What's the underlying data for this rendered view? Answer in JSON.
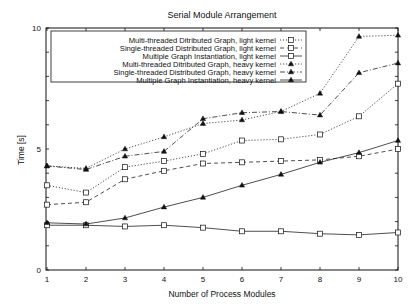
{
  "chart_data": {
    "type": "line",
    "title": "Serial Module Arrangement",
    "xlabel": "Number of Process Modules",
    "ylabel": "Time [s]",
    "xlim": [
      1,
      10
    ],
    "ylim": [
      0,
      10
    ],
    "x": [
      1,
      2,
      3,
      4,
      5,
      6,
      7,
      8,
      9,
      10
    ],
    "x_ticks": [
      "1",
      "2",
      "3",
      "4",
      "5",
      "6",
      "7",
      "8",
      "9",
      "10"
    ],
    "y_ticks": [
      "0",
      "5",
      "10"
    ],
    "grid": false,
    "legend_position": "upper-left-inside",
    "series": [
      {
        "name": "Multi-threaded Ditributed Graph, light kernel",
        "marker": "square",
        "line": "dotted",
        "values": [
          3.5,
          3.2,
          4.25,
          4.5,
          4.8,
          5.35,
          5.4,
          5.6,
          6.35,
          7.7
        ]
      },
      {
        "name": "Single-threaded Distributed Graph, light kernel",
        "marker": "square",
        "line": "dashed",
        "values": [
          2.7,
          2.8,
          3.75,
          4.1,
          4.4,
          4.45,
          4.5,
          4.55,
          4.7,
          5.0
        ]
      },
      {
        "name": "Multiple Graph Instantiation, light kernel",
        "marker": "square",
        "line": "solid",
        "values": [
          1.85,
          1.85,
          1.8,
          1.85,
          1.75,
          1.6,
          1.6,
          1.5,
          1.45,
          1.55
        ]
      },
      {
        "name": "Multi-threaded Ditributed Graph, heavy kernel",
        "marker": "triangle",
        "line": "dotted",
        "values": [
          4.3,
          4.2,
          5.0,
          5.5,
          6.05,
          6.2,
          6.55,
          7.3,
          9.65,
          9.7
        ]
      },
      {
        "name": "Single-threaded Distributed Graph, heavy kernel",
        "marker": "triangle",
        "line": "dashdot",
        "values": [
          4.3,
          4.15,
          4.7,
          4.9,
          6.25,
          6.5,
          6.55,
          6.4,
          8.15,
          8.55
        ]
      },
      {
        "name": "Multiple Graph Instantiation, heavy kernel",
        "marker": "triangle",
        "line": "solid",
        "values": [
          1.95,
          1.9,
          2.15,
          2.6,
          3.0,
          3.5,
          3.95,
          4.45,
          4.85,
          5.35
        ]
      }
    ]
  }
}
